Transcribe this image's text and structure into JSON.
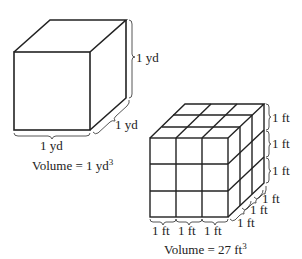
{
  "diagram": {
    "large_cube": {
      "height_label": "1 yd",
      "depth_label": "1 yd",
      "width_label": "1 yd",
      "volume_prefix": "Volume = 1 yd",
      "volume_exponent": "3"
    },
    "small_cube": {
      "grid": 3,
      "height_labels": [
        "1 ft",
        "1 ft",
        "1 ft"
      ],
      "depth_labels": [
        "1 ft",
        "1 ft",
        "1 ft"
      ],
      "width_labels": [
        "1 ft",
        "1 ft",
        "1 ft"
      ],
      "volume_prefix": "Volume = 27 ft",
      "volume_exponent": "3"
    },
    "colors": {
      "line": "#222222",
      "background": "#ffffff"
    }
  }
}
